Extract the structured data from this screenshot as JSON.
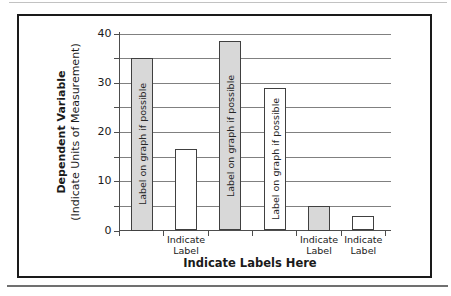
{
  "document": {
    "background": "#ffffff",
    "frame_border_color": "#1a1a1a",
    "top_edge_rule_color": "#c2c2c2",
    "bottom_rule_color": "#707070"
  },
  "chart_data": {
    "type": "bar",
    "xlabel": "Indicate Labels Here",
    "ylabel": "Dependent Variable",
    "ylabel_units": "(Indicate Units of Measurement)",
    "ylim": [
      0,
      40
    ],
    "yticks": [
      0,
      10,
      20,
      30,
      40
    ],
    "minor_tick_step": 5,
    "gridline_step": 5,
    "grid": true,
    "legend_position": "none",
    "categories": [
      "",
      "Indicate Label",
      "",
      "",
      "Indicate Label",
      "Indicate Label"
    ],
    "values": [
      35,
      16.5,
      38.5,
      29,
      5,
      3
    ],
    "bar_fills": [
      "#d8d8d8",
      "#ffffff",
      "#d8d8d8",
      "#ffffff",
      "#d8d8d8",
      "#ffffff"
    ],
    "bar_inner_labels": [
      "Label on graph if possible",
      "",
      "Label on graph if possible",
      "Label on graph if possible",
      "",
      ""
    ],
    "colors": {
      "bar_border": "#404040",
      "axis_line": "#4d4d4d",
      "gridline": "#808080",
      "text": "#1a1a1a"
    }
  }
}
